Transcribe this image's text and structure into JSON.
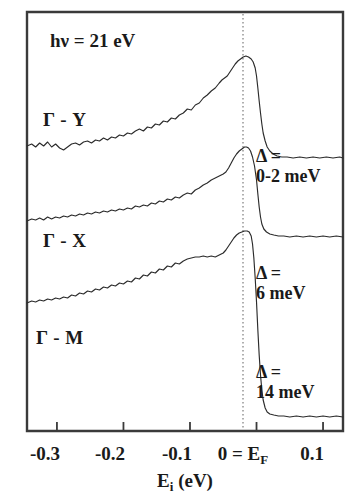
{
  "figure": {
    "photon_energy_label": "hν = 21 eV",
    "background_color": "#ffffff",
    "line_color": "#2b2b2b",
    "frame_color": "#3a3a3a",
    "fermi_line_color": "#8e8e8e"
  },
  "axis": {
    "x_title_main": "E",
    "x_title_sub": "i",
    "x_title_units": " (eV)",
    "x_title_full": "E_i (eV)",
    "tick_labels": [
      "-0.3",
      "-0.2",
      "-0.1",
      "0 = E_F",
      "0.1"
    ],
    "tick_values": [
      -0.3,
      -0.2,
      -0.1,
      0.0,
      0.1
    ],
    "tick_zero_main": "0 = E",
    "tick_zero_sub": "F",
    "xlim": [
      -0.345,
      0.13
    ],
    "y_axis_label": "",
    "grid": false
  },
  "curve_labels": [
    {
      "text": "Γ - Y",
      "x_px": 43,
      "y_px": 126
    },
    {
      "text": "Γ - X",
      "x_px": 43,
      "y_px": 247
    },
    {
      "text": "Γ - M",
      "x_px": 36,
      "y_px": 344
    }
  ],
  "gap_annotations": [
    {
      "line1": "Δ =",
      "line2": "0-2 meV",
      "x_px": 256,
      "y_px": 162
    },
    {
      "line1": "Δ =",
      "line2": "6 meV",
      "x_px": 256,
      "y_px": 279
    },
    {
      "line1": "Δ =",
      "line2": "14 meV",
      "x_px": 256,
      "y_px": 378
    }
  ],
  "chart_data": {
    "type": "line",
    "title": "",
    "subtitle": "hν = 21 eV",
    "xlabel": "E_i (eV)",
    "ylabel": "Photoemission intensity (arb. units)",
    "xlim": [
      -0.345,
      0.13
    ],
    "ylim": [
      0,
      1
    ],
    "grid": false,
    "legend_position": "inline-curve-labels",
    "annotations": [
      {
        "text": "hν = 21 eV",
        "x": -0.3,
        "y": 0.96
      },
      {
        "text": "Γ - Y",
        "x": -0.31,
        "y": 0.74
      },
      {
        "text": "Γ - X",
        "x": -0.31,
        "y": 0.46
      },
      {
        "text": "Γ - M",
        "x": -0.325,
        "y": 0.23
      },
      {
        "text": "Δ = 0-2 meV",
        "x": 0.02,
        "y": 0.66
      },
      {
        "text": "Δ = 6 meV",
        "x": 0.02,
        "y": 0.4
      },
      {
        "text": "Δ = 14 meV",
        "x": 0.02,
        "y": 0.17
      }
    ],
    "reference_lines": [
      {
        "axis": "x",
        "value": 0.0,
        "label": "E_F",
        "style": "dotted"
      }
    ],
    "series": [
      {
        "name": "Γ - Y",
        "gap_meV": "0-2",
        "offset_px": 0,
        "baseline_px": 146,
        "peak_x": -0.013,
        "peak_px": 56,
        "points": [
          [
            -0.345,
            146
          ],
          [
            -0.338,
            144
          ],
          [
            -0.332,
            147
          ],
          [
            -0.326,
            143
          ],
          [
            -0.32,
            146
          ],
          [
            -0.314,
            142
          ],
          [
            -0.308,
            147
          ],
          [
            -0.302,
            144
          ],
          [
            -0.296,
            148
          ],
          [
            -0.29,
            150
          ],
          [
            -0.284,
            147
          ],
          [
            -0.278,
            144
          ],
          [
            -0.272,
            143
          ],
          [
            -0.266,
            145
          ],
          [
            -0.26,
            142
          ],
          [
            -0.254,
            141
          ],
          [
            -0.248,
            143
          ],
          [
            -0.242,
            140
          ],
          [
            -0.236,
            141
          ],
          [
            -0.23,
            138
          ],
          [
            -0.224,
            140
          ],
          [
            -0.218,
            137
          ],
          [
            -0.212,
            138
          ],
          [
            -0.206,
            135
          ],
          [
            -0.2,
            136
          ],
          [
            -0.194,
            133
          ],
          [
            -0.188,
            134
          ],
          [
            -0.182,
            131
          ],
          [
            -0.176,
            129
          ],
          [
            -0.17,
            131
          ],
          [
            -0.164,
            127
          ],
          [
            -0.158,
            128
          ],
          [
            -0.152,
            124
          ],
          [
            -0.146,
            125
          ],
          [
            -0.14,
            121
          ],
          [
            -0.134,
            122
          ],
          [
            -0.128,
            118
          ],
          [
            -0.122,
            119
          ],
          [
            -0.116,
            115
          ],
          [
            -0.11,
            113
          ],
          [
            -0.104,
            109
          ],
          [
            -0.098,
            110
          ],
          [
            -0.092,
            105
          ],
          [
            -0.086,
            103
          ],
          [
            -0.08,
            98
          ],
          [
            -0.074,
            95
          ],
          [
            -0.068,
            91
          ],
          [
            -0.062,
            88
          ],
          [
            -0.056,
            83
          ],
          [
            -0.052,
            80
          ],
          [
            -0.048,
            78
          ],
          [
            -0.044,
            76
          ],
          [
            -0.04,
            72
          ],
          [
            -0.036,
            68
          ],
          [
            -0.032,
            64
          ],
          [
            -0.028,
            61
          ],
          [
            -0.024,
            59
          ],
          [
            -0.02,
            57
          ],
          [
            -0.016,
            56
          ],
          [
            -0.012,
            57
          ],
          [
            -0.008,
            59
          ],
          [
            -0.005,
            62
          ],
          [
            -0.002,
            68
          ],
          [
            0.0,
            76
          ],
          [
            0.002,
            88
          ],
          [
            0.004,
            101
          ],
          [
            0.006,
            113
          ],
          [
            0.008,
            124
          ],
          [
            0.01,
            133
          ],
          [
            0.013,
            141
          ],
          [
            0.016,
            147
          ],
          [
            0.02,
            151
          ],
          [
            0.025,
            154
          ],
          [
            0.031,
            156
          ],
          [
            0.038,
            157
          ],
          [
            0.046,
            157
          ],
          [
            0.055,
            158
          ],
          [
            0.065,
            157
          ],
          [
            0.075,
            158
          ],
          [
            0.085,
            157
          ],
          [
            0.095,
            158
          ],
          [
            0.105,
            157
          ],
          [
            0.115,
            158
          ],
          [
            0.125,
            157
          ],
          [
            0.13,
            158
          ]
        ]
      },
      {
        "name": "Γ - X",
        "gap_meV": "6",
        "offset_px": 0,
        "baseline_px": 219,
        "peak_x": -0.013,
        "peak_px": 147,
        "points": [
          [
            -0.345,
            221
          ],
          [
            -0.338,
            219
          ],
          [
            -0.332,
            220
          ],
          [
            -0.326,
            218
          ],
          [
            -0.32,
            220
          ],
          [
            -0.314,
            217
          ],
          [
            -0.308,
            219
          ],
          [
            -0.302,
            217
          ],
          [
            -0.296,
            218
          ],
          [
            -0.29,
            216
          ],
          [
            -0.284,
            217
          ],
          [
            -0.278,
            215
          ],
          [
            -0.272,
            216
          ],
          [
            -0.266,
            214
          ],
          [
            -0.26,
            215
          ],
          [
            -0.254,
            213
          ],
          [
            -0.248,
            214
          ],
          [
            -0.242,
            212
          ],
          [
            -0.236,
            213
          ],
          [
            -0.23,
            211
          ],
          [
            -0.224,
            212
          ],
          [
            -0.218,
            210
          ],
          [
            -0.212,
            211
          ],
          [
            -0.206,
            209
          ],
          [
            -0.2,
            210
          ],
          [
            -0.194,
            208
          ],
          [
            -0.188,
            209
          ],
          [
            -0.182,
            206
          ],
          [
            -0.176,
            207
          ],
          [
            -0.17,
            205
          ],
          [
            -0.164,
            206
          ],
          [
            -0.158,
            203
          ],
          [
            -0.152,
            204
          ],
          [
            -0.146,
            201
          ],
          [
            -0.14,
            202
          ],
          [
            -0.134,
            199
          ],
          [
            -0.128,
            200
          ],
          [
            -0.122,
            197
          ],
          [
            -0.116,
            198
          ],
          [
            -0.11,
            195
          ],
          [
            -0.104,
            193
          ],
          [
            -0.098,
            194
          ],
          [
            -0.092,
            190
          ],
          [
            -0.086,
            188
          ],
          [
            -0.08,
            185
          ],
          [
            -0.074,
            183
          ],
          [
            -0.068,
            180
          ],
          [
            -0.062,
            178
          ],
          [
            -0.056,
            176
          ],
          [
            -0.05,
            174
          ],
          [
            -0.046,
            172
          ],
          [
            -0.042,
            168
          ],
          [
            -0.038,
            163
          ],
          [
            -0.034,
            158
          ],
          [
            -0.03,
            154
          ],
          [
            -0.026,
            151
          ],
          [
            -0.022,
            149
          ],
          [
            -0.018,
            147
          ],
          [
            -0.015,
            147
          ],
          [
            -0.012,
            148
          ],
          [
            -0.009,
            151
          ],
          [
            -0.006,
            157
          ],
          [
            -0.003,
            166
          ],
          [
            0.0,
            180
          ],
          [
            0.002,
            194
          ],
          [
            0.004,
            207
          ],
          [
            0.006,
            217
          ],
          [
            0.008,
            224
          ],
          [
            0.011,
            229
          ],
          [
            0.015,
            232
          ],
          [
            0.02,
            234
          ],
          [
            0.026,
            235
          ],
          [
            0.033,
            236
          ],
          [
            0.041,
            236
          ],
          [
            0.05,
            237
          ],
          [
            0.06,
            236
          ],
          [
            0.07,
            237
          ],
          [
            0.08,
            236
          ],
          [
            0.09,
            237
          ],
          [
            0.1,
            236
          ],
          [
            0.11,
            237
          ],
          [
            0.12,
            236
          ],
          [
            0.13,
            237
          ]
        ]
      },
      {
        "name": "Γ - M",
        "gap_meV": "14",
        "offset_px": 0,
        "baseline_px": 302,
        "peak_x": -0.01,
        "peak_px": 231,
        "points": [
          [
            -0.345,
            303
          ],
          [
            -0.338,
            301
          ],
          [
            -0.332,
            302
          ],
          [
            -0.326,
            300
          ],
          [
            -0.32,
            301
          ],
          [
            -0.314,
            299
          ],
          [
            -0.308,
            300
          ],
          [
            -0.302,
            298
          ],
          [
            -0.296,
            299
          ],
          [
            -0.29,
            297
          ],
          [
            -0.284,
            298
          ],
          [
            -0.278,
            295
          ],
          [
            -0.272,
            296
          ],
          [
            -0.266,
            293
          ],
          [
            -0.26,
            294
          ],
          [
            -0.254,
            291
          ],
          [
            -0.248,
            292
          ],
          [
            -0.242,
            289
          ],
          [
            -0.236,
            290
          ],
          [
            -0.23,
            287
          ],
          [
            -0.224,
            288
          ],
          [
            -0.218,
            285
          ],
          [
            -0.212,
            286
          ],
          [
            -0.206,
            283
          ],
          [
            -0.2,
            284
          ],
          [
            -0.194,
            281
          ],
          [
            -0.188,
            282
          ],
          [
            -0.182,
            278
          ],
          [
            -0.176,
            279
          ],
          [
            -0.17,
            275
          ],
          [
            -0.164,
            276
          ],
          [
            -0.158,
            272
          ],
          [
            -0.152,
            273
          ],
          [
            -0.146,
            269
          ],
          [
            -0.14,
            270
          ],
          [
            -0.134,
            266
          ],
          [
            -0.128,
            267
          ],
          [
            -0.122,
            263
          ],
          [
            -0.116,
            264
          ],
          [
            -0.11,
            261
          ],
          [
            -0.104,
            259
          ],
          [
            -0.098,
            258
          ],
          [
            -0.092,
            257
          ],
          [
            -0.086,
            257
          ],
          [
            -0.08,
            256
          ],
          [
            -0.074,
            257
          ],
          [
            -0.068,
            256
          ],
          [
            -0.062,
            257
          ],
          [
            -0.056,
            255
          ],
          [
            -0.05,
            253
          ],
          [
            -0.046,
            250
          ],
          [
            -0.042,
            246
          ],
          [
            -0.038,
            242
          ],
          [
            -0.034,
            238
          ],
          [
            -0.03,
            235
          ],
          [
            -0.026,
            233
          ],
          [
            -0.022,
            232
          ],
          [
            -0.018,
            231
          ],
          [
            -0.014,
            231
          ],
          [
            -0.011,
            232
          ],
          [
            -0.008,
            236
          ],
          [
            -0.006,
            244
          ],
          [
            -0.004,
            258
          ],
          [
            -0.002,
            278
          ],
          [
            0.0,
            302
          ],
          [
            0.002,
            330
          ],
          [
            0.004,
            355
          ],
          [
            0.006,
            375
          ],
          [
            0.008,
            390
          ],
          [
            0.01,
            400
          ],
          [
            0.013,
            408
          ],
          [
            0.016,
            412
          ],
          [
            0.02,
            414
          ],
          [
            0.026,
            415
          ],
          [
            0.033,
            416
          ],
          [
            0.041,
            416
          ],
          [
            0.05,
            417
          ],
          [
            0.06,
            416
          ],
          [
            0.07,
            417
          ],
          [
            0.08,
            416
          ],
          [
            0.09,
            417
          ],
          [
            0.1,
            416
          ],
          [
            0.11,
            417
          ],
          [
            0.12,
            416
          ],
          [
            0.13,
            417
          ]
        ]
      }
    ]
  }
}
